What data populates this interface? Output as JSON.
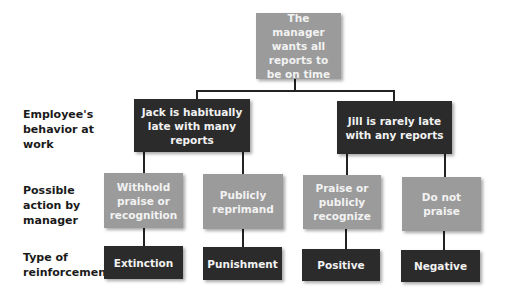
{
  "diagram": {
    "root": {
      "label": "The manager wants all reports to be on time"
    },
    "row_labels": [
      {
        "label": "Employee's behavior at work"
      },
      {
        "label": "Possible action by manager"
      },
      {
        "label": "Type of reinforcement"
      }
    ],
    "behaviors": [
      {
        "label": "Jack is habitually late with many reports"
      },
      {
        "label": "Jill is rarely late with any reports"
      }
    ],
    "actions": [
      {
        "label": "Withhold praise or recognition"
      },
      {
        "label": "Publicly reprimand"
      },
      {
        "label": "Praise or publicly recognize"
      },
      {
        "label": "Do not praise"
      }
    ],
    "reinforcements": [
      {
        "label": "Extinction"
      },
      {
        "label": "Punishment"
      },
      {
        "label": "Positive"
      },
      {
        "label": "Negative"
      }
    ],
    "colors": {
      "gray_box": "#9b9b9b",
      "dark_box": "#2b2b2b",
      "text_light": "#f2f2f2"
    }
  }
}
